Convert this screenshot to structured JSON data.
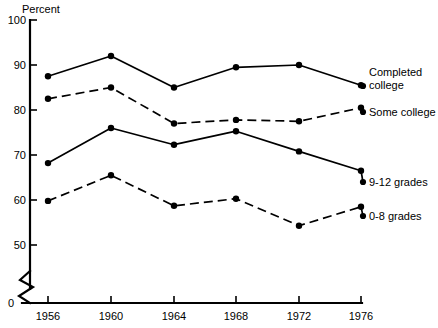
{
  "chart_data": {
    "type": "line",
    "title": "",
    "xlabel": "",
    "ylabel": "Percent",
    "ylim": [
      50,
      100
    ],
    "xlim": [
      1956,
      1976
    ],
    "grid": false,
    "legend_position": "right-inline",
    "y_axis_break": true,
    "y_axis_break_note": "axis breaks between 0 and 50",
    "x": [
      1956,
      1960,
      1964,
      1968,
      1972,
      1976
    ],
    "categories": [
      "1956",
      "1960",
      "1964",
      "1968",
      "1972",
      "1976"
    ],
    "yticks": [
      100,
      90,
      80,
      70,
      60,
      50,
      0
    ],
    "ytick_labels": [
      "100",
      "90",
      "80",
      "70",
      "60",
      "50",
      "0"
    ],
    "series": [
      {
        "name": "Completed college",
        "label": "Completed\ncollege",
        "label_line1": "Completed",
        "label_line2": "college",
        "style": "solid",
        "values": [
          87.5,
          92.0,
          85.0,
          89.5,
          90.0,
          85.5
        ]
      },
      {
        "name": "Some college",
        "label": "Some college",
        "label_line1": "Some college",
        "label_line2": "",
        "style": "dashed",
        "values": [
          82.5,
          85.0,
          77.0,
          77.8,
          77.5,
          80.5
        ]
      },
      {
        "name": "9-12 grades",
        "label": "9-12 grades",
        "label_line1": "9-12 grades",
        "label_line2": "",
        "style": "solid",
        "values": [
          68.2,
          76.0,
          72.3,
          75.3,
          70.8,
          66.5
        ]
      },
      {
        "name": "0-8 grades",
        "label": "0-8 grades",
        "label_line1": "0-8 grades",
        "label_line2": "",
        "style": "dashed",
        "values": [
          59.8,
          65.5,
          58.7,
          60.3,
          54.3,
          58.5
        ]
      }
    ]
  },
  "axis": {
    "y_title": "Percent",
    "y_tick_100": "100",
    "y_tick_90": "90",
    "y_tick_80": "80",
    "y_tick_70": "70",
    "y_tick_60": "60",
    "y_tick_50": "50",
    "y_tick_0": "0",
    "x_tick_1956": "1956",
    "x_tick_1960": "1960",
    "x_tick_1964": "1964",
    "x_tick_1968": "1968",
    "x_tick_1972": "1972",
    "x_tick_1976": "1976"
  },
  "legend": {
    "completed_college_line1": "Completed",
    "completed_college_line2": "college",
    "some_college": "Some college",
    "grades_9_12": "9-12 grades",
    "grades_0_8": "0-8 grades"
  },
  "colors": {
    "ink": "#000000",
    "background": "#ffffff"
  }
}
